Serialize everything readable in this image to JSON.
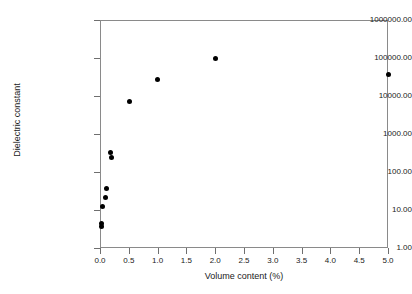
{
  "chart_data": {
    "type": "scatter",
    "title": "",
    "xlabel": "Volume content  (%)",
    "ylabel": "Dielectric constant",
    "xlim": [
      0.0,
      5.0
    ],
    "ylim": [
      1.0,
      1000000.0
    ],
    "yscale": "log",
    "xscale": "linear",
    "grid": false,
    "legend": null,
    "xticks": [
      "0.0",
      "0.5",
      "1.0",
      "1.5",
      "2.0",
      "2.5",
      "3.0",
      "3.5",
      "4.0",
      "4.5",
      "5.0"
    ],
    "xtick_values": [
      0.0,
      0.5,
      1.0,
      1.5,
      2.0,
      2.5,
      3.0,
      3.5,
      4.0,
      4.5,
      5.0
    ],
    "yticks": [
      "1.00",
      "10.00",
      "100.00",
      "1000.00",
      "10000.00",
      "100000.00",
      "1000000.00"
    ],
    "ytick_values": [
      1,
      10,
      100,
      1000,
      10000,
      100000,
      1000000
    ],
    "series": [
      {
        "name": "Dielectric constant vs volume content",
        "marker": "filled-circle",
        "color": "#000000",
        "points": [
          {
            "x": 0.02,
            "y": 4.3
          },
          {
            "x": 0.03,
            "y": 3.6
          },
          {
            "x": 0.05,
            "y": 12.0
          },
          {
            "x": 0.09,
            "y": 21.0
          },
          {
            "x": 0.12,
            "y": 37.0
          },
          {
            "x": 0.19,
            "y": 330.0
          },
          {
            "x": 0.2,
            "y": 240.0
          },
          {
            "x": 0.52,
            "y": 7200.0
          },
          {
            "x": 1.0,
            "y": 27000.0
          },
          {
            "x": 2.0,
            "y": 98000.0
          },
          {
            "x": 5.0,
            "y": 37000.0
          }
        ]
      }
    ]
  },
  "axes": {
    "frame_color": "#8a8a8a",
    "tick_color": "#6f6f6f",
    "text_color": "#1a1a1a"
  }
}
